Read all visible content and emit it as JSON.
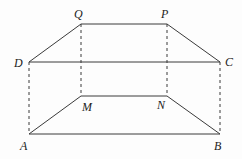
{
  "diagram": {
    "type": "geometry-figure",
    "colors": {
      "background": "#fdfdfd",
      "stroke": "#3a3a3a",
      "label": "#222222"
    },
    "points": {
      "A": {
        "label": "A",
        "x": 29,
        "y": 134
      },
      "B": {
        "label": "B",
        "x": 220,
        "y": 134
      },
      "C": {
        "label": "C",
        "x": 220,
        "y": 62
      },
      "D": {
        "label": "D",
        "x": 29,
        "y": 62
      },
      "M": {
        "label": "M",
        "x": 81,
        "y": 96
      },
      "N": {
        "label": "N",
        "x": 167,
        "y": 96
      },
      "P": {
        "label": "P",
        "x": 167,
        "y": 24
      },
      "Q": {
        "label": "Q",
        "x": 81,
        "y": 24
      }
    },
    "solid_edges": [
      [
        "D",
        "Q"
      ],
      [
        "Q",
        "P"
      ],
      [
        "P",
        "C"
      ],
      [
        "D",
        "C"
      ],
      [
        "A",
        "M"
      ],
      [
        "M",
        "N"
      ],
      [
        "N",
        "B"
      ],
      [
        "A",
        "B"
      ]
    ],
    "dashed_edges": [
      [
        "D",
        "A"
      ],
      [
        "Q",
        "M"
      ],
      [
        "P",
        "N"
      ],
      [
        "C",
        "B"
      ]
    ]
  }
}
